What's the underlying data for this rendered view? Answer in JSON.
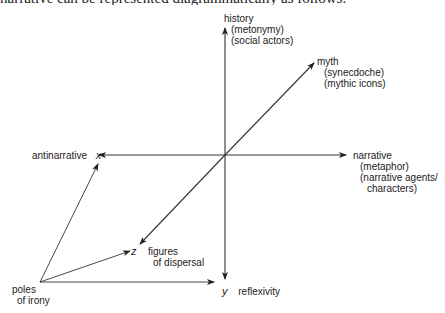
{
  "caption": {
    "partial_text": "narrative can be represented diagrammatically as follows:"
  },
  "diagram": {
    "axes": {
      "vertical": {
        "top_label": "history",
        "top_sub1": "(metonymy)",
        "top_sub2": "(social actors)",
        "bottom_var": "y",
        "bottom_label": "reflexivity"
      },
      "horizontal": {
        "left_label": "antinarrative",
        "left_var": "x",
        "right_label": "narrative",
        "right_sub1": "(metaphor)",
        "right_sub2": "(narrative agents/",
        "right_sub3": "characters)"
      },
      "diagonal": {
        "upper_label": "myth",
        "upper_sub1": "(synecdoche)",
        "upper_sub2": "(mythic icons)",
        "lower_var": "z",
        "lower_label1": "figures",
        "lower_label2": "of dispersal"
      }
    },
    "origin": {
      "label1": "poles",
      "label2": "of irony"
    },
    "colors": {
      "line": "#333333",
      "text": "#222222"
    }
  }
}
